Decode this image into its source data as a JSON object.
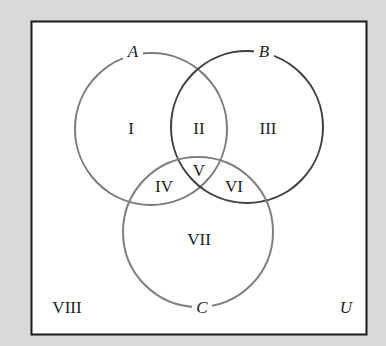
{
  "diagram": {
    "type": "venn",
    "universe_label": "U",
    "colors": {
      "background": "#d9d9d9",
      "box_fill": "#ffffff",
      "box_border": "#1a1a1a",
      "circle_a": "#7a7a7a",
      "circle_b": "#3f3f3f",
      "circle_c": "#7f7f7f",
      "text": "#222222"
    },
    "sets": [
      {
        "name": "A",
        "cx": 151,
        "cy": 129,
        "r": 76
      },
      {
        "name": "B",
        "cx": 247,
        "cy": 127,
        "r": 76
      },
      {
        "name": "C",
        "cx": 198,
        "cy": 232,
        "r": 75
      }
    ],
    "regions": [
      {
        "id": "I",
        "label": "I"
      },
      {
        "id": "II",
        "label": "II"
      },
      {
        "id": "III",
        "label": "III"
      },
      {
        "id": "IV",
        "label": "IV"
      },
      {
        "id": "V",
        "label": "V"
      },
      {
        "id": "VI",
        "label": "VI"
      },
      {
        "id": "VII",
        "label": "VII"
      },
      {
        "id": "VIII",
        "label": "VIII"
      }
    ]
  }
}
